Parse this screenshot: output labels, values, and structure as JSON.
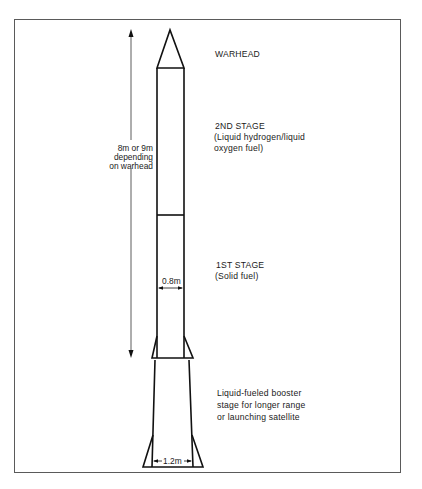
{
  "diagram": {
    "type": "rocket-schematic",
    "labels": {
      "warhead": "WARHEAD",
      "second_stage": {
        "title": "2ND STAGE",
        "line1": "(Liquid hydrogen/liquid",
        "line2": " oxygen fuel)"
      },
      "first_stage": {
        "title": "1ST STAGE",
        "line1": "(Solid fuel)"
      },
      "booster": {
        "line1": "Liquid-fueled booster",
        "line2": "stage for longer range",
        "line3": "or launching satellite"
      }
    },
    "dimensions": {
      "length": {
        "line1": "8m or 9m",
        "line2": "depending",
        "line3": "on warhead"
      },
      "body_diameter": "0.8m",
      "booster_diameter": "1.2m"
    },
    "colors": {
      "line": "#111111",
      "frame": "#5a5a5a",
      "background": "#ffffff"
    }
  }
}
